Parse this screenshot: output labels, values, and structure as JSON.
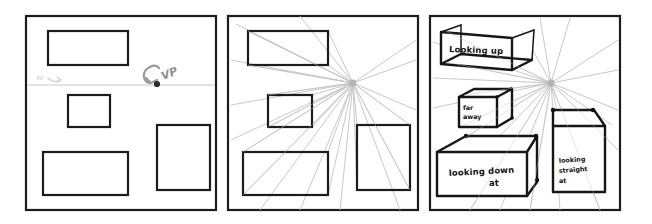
{
  "figure": {
    "background_color": "#ffffff",
    "ink_color": "#1c1c1c",
    "guide_color": "#c2c2c2",
    "width": 652,
    "height": 224
  },
  "panels": [
    {
      "id": "panel-1",
      "name": "flat-shapes-with-vanishing-point",
      "frame": {
        "x": 26,
        "y": 16,
        "w": 190,
        "h": 194
      },
      "horizon": {
        "y": 85,
        "x1": 27,
        "x2": 215,
        "label": "horizon-line"
      },
      "vanishing_point": {
        "x": 157,
        "y": 84,
        "label": "VP"
      },
      "vp_note": "VP",
      "faint_note": "hl",
      "rects": [
        {
          "name": "rect-top",
          "x": 48,
          "y": 31,
          "w": 80,
          "h": 34
        },
        {
          "name": "rect-middle",
          "x": 68,
          "y": 95,
          "w": 42,
          "h": 32
        },
        {
          "name": "rect-bottom-left",
          "x": 43,
          "y": 152,
          "w": 85,
          "h": 43
        },
        {
          "name": "rect-right",
          "x": 157,
          "y": 125,
          "w": 53,
          "h": 65
        }
      ]
    },
    {
      "id": "panel-2",
      "name": "shapes-with-perspective-guide-lines",
      "frame": {
        "x": 228,
        "y": 16,
        "w": 190,
        "h": 194
      },
      "vanishing_point": {
        "x": 353,
        "y": 83,
        "label": "vanishing-point"
      },
      "rects": [
        {
          "name": "rect-top",
          "x": 248,
          "y": 31,
          "w": 80,
          "h": 34
        },
        {
          "name": "rect-middle",
          "x": 268,
          "y": 95,
          "w": 44,
          "h": 32
        },
        {
          "name": "rect-bottom-left",
          "x": 243,
          "y": 152,
          "w": 85,
          "h": 43
        },
        {
          "name": "rect-right",
          "x": 357,
          "y": 125,
          "w": 53,
          "h": 65
        }
      ]
    },
    {
      "id": "panel-3",
      "name": "finished-perspective-boxes-with-labels",
      "frame": {
        "x": 430,
        "y": 16,
        "w": 190,
        "h": 194
      },
      "vanishing_point": {
        "x": 551,
        "y": 83,
        "label": "vanishing-point"
      },
      "boxes": [
        {
          "name": "box-looking-up",
          "label": "Looking up",
          "view": "from below"
        },
        {
          "name": "box-far-away",
          "label": "far\naway",
          "view": "distant"
        },
        {
          "name": "box-looking-down-at",
          "label": "looking down\nat",
          "view": "from above"
        },
        {
          "name": "box-looking-straight-at",
          "label": "looking\nstraight\nat",
          "view": "eye level"
        }
      ]
    }
  ],
  "labels": {
    "looking_up": "Looking up",
    "far": "far",
    "away": "away",
    "looking_down": "looking down",
    "at": "at",
    "looking": "looking",
    "straight": "straight",
    "at2": "at",
    "vp": "VP",
    "hl": "hl"
  }
}
